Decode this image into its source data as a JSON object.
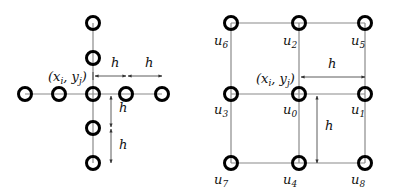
{
  "left_diagram": {
    "title": "five-point stencil",
    "center_label": {
      "open": "(",
      "x": "x",
      "x_sub": "i",
      "sep": ", ",
      "y": "y",
      "y_sub": "j",
      "close": ")"
    },
    "spacing_labels": [
      "h",
      "h",
      "h",
      "h"
    ],
    "nodes": 9
  },
  "right_diagram": {
    "title": "nine-point grid",
    "center_label": {
      "open": "(",
      "x": "x",
      "x_sub": "i",
      "sep": ", ",
      "y": "y",
      "y_sub": "j",
      "close": ")"
    },
    "spacing_labels": [
      "h",
      "h"
    ],
    "node_labels": {
      "u6": {
        "base": "u",
        "sub": "6"
      },
      "u2": {
        "base": "u",
        "sub": "2"
      },
      "u5": {
        "base": "u",
        "sub": "5"
      },
      "u3": {
        "base": "u",
        "sub": "3"
      },
      "u0": {
        "base": "u",
        "sub": "0"
      },
      "u1": {
        "base": "u",
        "sub": "1"
      },
      "u7": {
        "base": "u",
        "sub": "7"
      },
      "u4": {
        "base": "u",
        "sub": "4"
      },
      "u8": {
        "base": "u",
        "sub": "8"
      }
    }
  },
  "colors": {
    "node_stroke": "#000000",
    "line": "#888888",
    "text": "#111111"
  }
}
